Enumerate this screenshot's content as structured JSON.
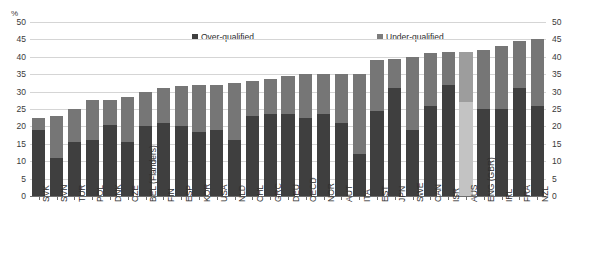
{
  "axis": {
    "unit_label": "%",
    "yticks": [
      "0",
      "5",
      "10",
      "15",
      "20",
      "25",
      "30",
      "35",
      "40",
      "45",
      "50"
    ]
  },
  "legend": {
    "over_label": "Over-qualified",
    "under_label": "Under-qualified",
    "over_color": "#3f3f3f",
    "under_color": "#767676",
    "highlight_over_color": "#c3c3c3",
    "highlight_under_color": "#9d9d9d"
  },
  "chart_data": {
    "type": "bar",
    "title": "",
    "subtitle": "",
    "xlabel": "",
    "ylabel": "%",
    "ylim": [
      0,
      50
    ],
    "ytick_step": 5,
    "grid": true,
    "stacked": true,
    "legend_position": "top-inside",
    "dual_axis": true,
    "highlight_category": "AUS",
    "categories": [
      "SVK",
      "SVN",
      "TUR",
      "POL",
      "DNK",
      "CZE",
      "BEL (Flanders)",
      "FIN",
      "ESP",
      "KOR",
      "USA",
      "NLD",
      "CHL",
      "GRC",
      "DEU",
      "OECD",
      "NOR",
      "AUT",
      "ITA",
      "EST",
      "JPN",
      "SWE",
      "CAN",
      "ISR",
      "AUS",
      "ENG (GBR)",
      "IRL",
      "FRA",
      "NZL"
    ],
    "series": [
      {
        "name": "Over-qualified",
        "values": [
          19.0,
          11.0,
          15.5,
          16.0,
          20.5,
          15.5,
          20.0,
          21.0,
          20.0,
          18.5,
          19.0,
          16.0,
          23.0,
          23.5,
          23.5,
          22.5,
          23.5,
          21.0,
          12.0,
          24.5,
          31.0,
          19.0,
          26.0,
          32.0,
          27.0,
          25.0,
          25.0,
          31.0,
          26.0
        ]
      },
      {
        "name": "Under-qualified",
        "values": [
          3.5,
          12.0,
          9.5,
          11.5,
          7.0,
          13.0,
          10.0,
          10.0,
          11.5,
          13.5,
          13.0,
          16.5,
          10.0,
          10.0,
          11.0,
          12.5,
          11.5,
          14.0,
          23.0,
          14.5,
          8.5,
          21.0,
          15.0,
          9.5,
          14.5,
          17.0,
          18.0,
          13.5,
          19.0
        ]
      }
    ],
    "totals": [
      22.5,
      23.0,
      25.0,
      27.5,
      27.5,
      28.5,
      30.0,
      31.0,
      31.5,
      32.0,
      32.0,
      32.5,
      33.0,
      33.5,
      34.5,
      35.0,
      35.0,
      35.0,
      35.0,
      39.0,
      39.5,
      40.0,
      41.0,
      41.5,
      41.5,
      42.0,
      43.0,
      44.5,
      45.0
    ]
  }
}
